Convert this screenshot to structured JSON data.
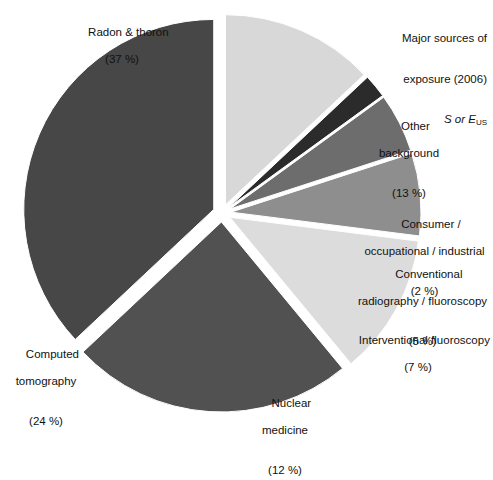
{
  "title": {
    "line1": "Major sources of",
    "line2": "exposure (2006)",
    "sym_s": "S",
    "sym_or": "or",
    "sym_e": "E",
    "sym_sub": "US"
  },
  "chart_data": {
    "type": "pie",
    "categories": [
      "Radon & thoron",
      "Other background",
      "Consumer / occupational / industrial",
      "Conventional radiography / fluoroscopy",
      "Interventional fluoroscopy",
      "Nuclear medicine",
      "Computed tomography"
    ],
    "values": [
      37,
      13,
      2,
      5,
      7,
      12,
      24
    ],
    "unit": "%",
    "colors": [
      "#474747",
      "#d8d8d8",
      "#2b2b2b",
      "#6d6d6d",
      "#8e8e8e",
      "#dcdcdc",
      "#515151"
    ],
    "exploded": true,
    "legend": "labels-outside",
    "slices": [
      {
        "name": "radon",
        "label_line1": "Radon & thoron",
        "label_pct": "(37 %)",
        "value": 37,
        "color": "#474747"
      },
      {
        "name": "other-background",
        "label_line1": "Other",
        "label_line2": "background",
        "label_pct": "(13 %)",
        "value": 13,
        "color": "#d8d8d8"
      },
      {
        "name": "consumer-occupational-industrial",
        "label_line1": "Consumer /",
        "label_line2": "occupational / industrial",
        "label_pct": "(2 %)",
        "value": 2,
        "color": "#2b2b2b"
      },
      {
        "name": "conventional-radiography-fluoroscopy",
        "label_line1": "Conventional",
        "label_line2": "radiography / fluoroscopy",
        "label_pct": "(5 %)",
        "value": 5,
        "color": "#6d6d6d"
      },
      {
        "name": "interventional-fluoroscopy",
        "label_line1": "Interventional fluoroscopy",
        "label_pct": "(7 %)",
        "value": 7,
        "color": "#8e8e8e"
      },
      {
        "name": "nuclear-medicine",
        "label_line1": "Nuclear",
        "label_line2": "medicine",
        "label_pct": "(12 %)",
        "value": 12,
        "color": "#dcdcdc"
      },
      {
        "name": "computed-tomography",
        "label_line1": "Computed",
        "label_line2": "tomography",
        "label_pct": "(24 %)",
        "value": 24,
        "color": "#515151"
      }
    ]
  }
}
